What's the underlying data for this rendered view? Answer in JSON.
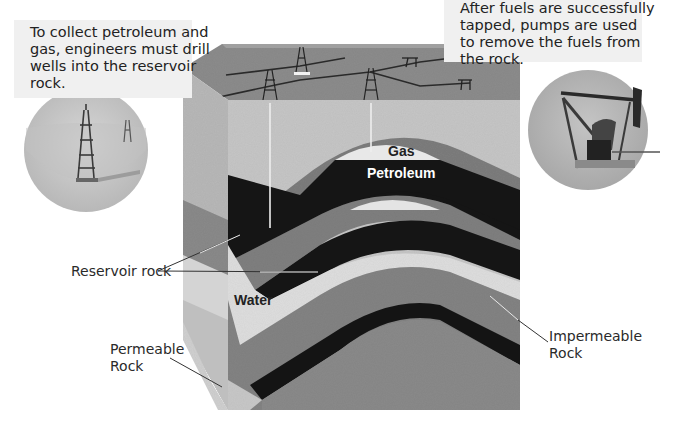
{
  "callouts": {
    "drill": {
      "lines": [
        "To collect petroleum and",
        "gas, engineers must drill",
        "wells into the reservoir",
        "rock."
      ]
    },
    "pump": {
      "lines": [
        "After fuels are successfully",
        "tapped, pumps are used",
        "to remove the fuels from",
        "the rock."
      ]
    }
  },
  "layer_labels": {
    "gas": "Gas",
    "petroleum": "Petroleum",
    "water": "Water"
  },
  "pointer_labels": {
    "reservoir_rock": "Reservoir rock",
    "permeable_rock": [
      "Permeable",
      "Rock"
    ],
    "impermeable_rock": [
      "Impermeable",
      "Rock"
    ]
  },
  "inset_images": {
    "left": "oil-derrick-inset",
    "right": "pump-jack-inset"
  },
  "colors": {
    "top_surface": "#8a8a8a",
    "light_rock": "#c8c8c8",
    "mid_rock": "#7c7c7c",
    "petroleum": "#161616",
    "gas": "#e8e8e8",
    "water": "#dcdcdc",
    "permeable": "#bdbdbd",
    "inset_bg": "#b4b4b4",
    "callout_bg": "#f0f0f0"
  }
}
